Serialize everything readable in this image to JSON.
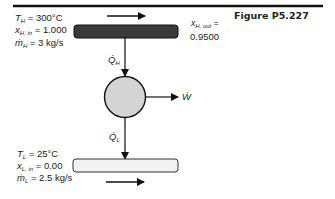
{
  "figure": {
    "title": "Figure P5.227"
  },
  "hot_stream": {
    "temperature_label": "T",
    "temperature_sub": "H",
    "temperature_value": "= 300°C",
    "quality_in_label": "x",
    "quality_in_sub": "H, in",
    "quality_in_value": "= 1.000",
    "mass_flow_label": "ṁ",
    "mass_flow_sub": "H",
    "mass_flow_value": "= 3 kg/s",
    "quality_out_label": "x",
    "quality_out_sub": "H, out",
    "quality_out_eq": "=",
    "quality_out_value": "0.9500",
    "pipe_color": "#3a3a3a",
    "flow_direction": "right"
  },
  "cold_stream": {
    "temperature_label": "T",
    "temperature_sub": "L",
    "temperature_value": "= 25°C",
    "quality_in_label": "x",
    "quality_in_sub": "L, in",
    "quality_in_value": "= 0.00",
    "mass_flow_label": "ṁ",
    "mass_flow_sub": "L",
    "mass_flow_value": "= 2.5 kg/s",
    "pipe_color": "#f2f2f2",
    "flow_direction": "right"
  },
  "engine": {
    "heat_in_label": "Q̇",
    "heat_in_sub": "H",
    "heat_out_label": "Q̇",
    "heat_out_sub": "L",
    "work_label": "Ẇ",
    "fill_color": "#d4d4d4"
  }
}
